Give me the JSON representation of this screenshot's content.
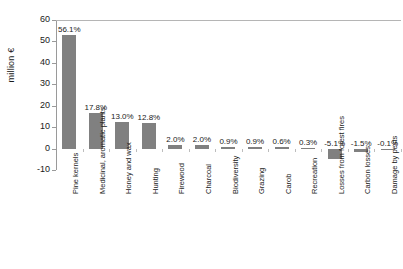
{
  "chart_data": {
    "type": "bar",
    "title": "",
    "xlabel": "",
    "ylabel": "million €",
    "ylim": [
      -10,
      60
    ],
    "yticks": [
      60,
      50,
      40,
      30,
      20,
      10,
      0,
      -10
    ],
    "grid": false,
    "legend": "none",
    "bar_color": "#808080",
    "categories": [
      "Pine kernels",
      "Medicinal, aromatic plants",
      "Honey and wax",
      "Hunting",
      "Firewood",
      "Charcoal",
      "Biodiversity",
      "Grazing",
      "Carob",
      "Recreation",
      "Losses from forest fires",
      "Carbon losses",
      "Damage by pests"
    ],
    "values": [
      53.0,
      16.8,
      12.3,
      12.1,
      1.9,
      1.9,
      0.85,
      0.85,
      0.57,
      0.28,
      -4.8,
      -1.4,
      -0.1
    ],
    "data_labels": [
      "56.1%",
      "17.8%",
      "13.0%",
      "12.8%",
      "2.0%",
      "2.0%",
      "0.9%",
      "0.9%",
      "0.6%",
      "0.3%",
      "-5.1%",
      "-1.5%",
      "-0.1%"
    ]
  }
}
